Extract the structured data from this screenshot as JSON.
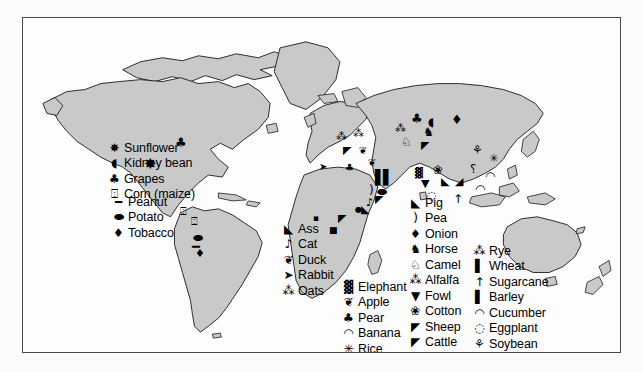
{
  "figure": {
    "kind": "world-map",
    "colors": {
      "land_fill": "#c9c9c9",
      "ocean_fill": "#fdfdfd",
      "outline": "#1a1a1a",
      "frame": "#4a4a4a",
      "page": "#fbfbfb",
      "symbol": "#000000"
    }
  },
  "legends": {
    "north_america": {
      "name": "north-america-legend",
      "items": [
        {
          "label": "Sunflower",
          "icon": "sunflower-icon",
          "glyph": "✸"
        },
        {
          "label": "Kidney bean",
          "icon": "kidney-bean-icon",
          "glyph": "◖"
        },
        {
          "label": "Grapes",
          "icon": "grapes-icon",
          "glyph": "♣"
        },
        {
          "label": "Corn (maize)",
          "icon": "corn-icon",
          "glyph": "⍠"
        }
      ]
    },
    "south_america": {
      "name": "south-america-legend",
      "items": [
        {
          "label": "Peanut",
          "icon": "peanut-icon",
          "glyph": "━"
        },
        {
          "label": "Potato",
          "icon": "potato-icon",
          "glyph": "⬬"
        },
        {
          "label": "Tobacco",
          "icon": "tobacco-icon",
          "glyph": "♦"
        }
      ]
    },
    "africa_left": {
      "name": "africa-left-legend",
      "items": [
        {
          "label": "Ass",
          "icon": "ass-icon",
          "glyph": "◣"
        },
        {
          "label": "Cat",
          "icon": "cat-icon",
          "glyph": "♪"
        },
        {
          "label": "Duck",
          "icon": "duck-icon",
          "glyph": "❦"
        },
        {
          "label": "Rabbit",
          "icon": "rabbit-icon",
          "glyph": "➤"
        },
        {
          "label": "Oats",
          "icon": "oats-icon",
          "glyph": "⁂"
        }
      ]
    },
    "africa_crops": {
      "name": "africa-crops-legend",
      "items": [
        {
          "label": "Elephant",
          "icon": "elephant-icon",
          "glyph": "▓"
        },
        {
          "label": "Apple",
          "icon": "apple-icon",
          "glyph": "❦"
        },
        {
          "label": "Pear",
          "icon": "pear-icon",
          "glyph": "♣"
        },
        {
          "label": "Banana",
          "icon": "banana-icon",
          "glyph": "◠"
        },
        {
          "label": "Rice",
          "icon": "rice-icon",
          "glyph": "✳"
        },
        {
          "label": "Lentil",
          "icon": "lentil-icon",
          "glyph": "⬬"
        }
      ]
    },
    "eurasia_middle": {
      "name": "eurasia-middle-legend",
      "items": [
        {
          "label": "Pig",
          "icon": "pig-icon",
          "glyph": "◣"
        },
        {
          "label": "Pea",
          "icon": "pea-icon",
          "glyph": ")"
        },
        {
          "label": "Onion",
          "icon": "onion-icon",
          "glyph": "♦"
        },
        {
          "label": "Horse",
          "icon": "horse-icon",
          "glyph": "♞"
        },
        {
          "label": "Camel",
          "icon": "camel-icon",
          "glyph": "♘"
        },
        {
          "label": "Alfalfa",
          "icon": "alfalfa-icon",
          "glyph": "⁂"
        },
        {
          "label": "Fowl",
          "icon": "fowl-icon",
          "glyph": "▼"
        },
        {
          "label": "Cotton",
          "icon": "cotton-icon",
          "glyph": "❀"
        },
        {
          "label": "Sheep",
          "icon": "sheep-icon",
          "glyph": "◤"
        },
        {
          "label": "Cattle",
          "icon": "cattle-icon",
          "glyph": "◤"
        },
        {
          "label": "Dog",
          "icon": "dog-icon",
          "glyph": "◢"
        }
      ]
    },
    "asia_right": {
      "name": "asia-right-legend",
      "items": [
        {
          "label": "Rye",
          "icon": "rye-icon",
          "glyph": "⁂"
        },
        {
          "label": "Wheat",
          "icon": "wheat-icon",
          "glyph": "▌"
        },
        {
          "label": "Sugarcane",
          "icon": "sugarcane-icon",
          "glyph": "↑"
        },
        {
          "label": "Barley",
          "icon": "barley-icon",
          "glyph": "▌"
        },
        {
          "label": "Cucumber",
          "icon": "cucumber-icon",
          "glyph": "◠"
        },
        {
          "label": "Eggplant",
          "icon": "eggplant-icon",
          "glyph": "◌"
        },
        {
          "label": "Soybean",
          "icon": "soybean-icon",
          "glyph": "⚘"
        },
        {
          "label": "Millet",
          "icon": "millet-icon",
          "glyph": "⸮"
        }
      ]
    }
  },
  "map_symbols": [
    {
      "name": "symbol-grapes-great-lakes",
      "glyph": "♣",
      "x": 152,
      "y": 118,
      "size": 13
    },
    {
      "name": "symbol-sunflower-plains",
      "glyph": "✸",
      "x": 121,
      "y": 139,
      "size": 15
    },
    {
      "name": "symbol-corn-mexico",
      "glyph": "⍠",
      "x": 157,
      "y": 188,
      "size": 11
    },
    {
      "name": "symbol-corn-andes",
      "glyph": "⍠",
      "x": 168,
      "y": 198,
      "size": 11
    },
    {
      "name": "symbol-potato-andes",
      "glyph": "⬬",
      "x": 170,
      "y": 214,
      "size": 12
    },
    {
      "name": "symbol-peanut-andes",
      "glyph": "━",
      "x": 169,
      "y": 222,
      "size": 13
    },
    {
      "name": "symbol-tobacco-andes",
      "glyph": "♦",
      "x": 172,
      "y": 230,
      "size": 11
    },
    {
      "name": "symbol-oats-europe",
      "glyph": "⁂",
      "x": 313,
      "y": 113,
      "size": 11
    },
    {
      "name": "symbol-rye-europe",
      "glyph": "⁂",
      "x": 330,
      "y": 110,
      "size": 11
    },
    {
      "name": "symbol-cattle-europe",
      "glyph": "◤",
      "x": 320,
      "y": 127,
      "size": 11
    },
    {
      "name": "symbol-duck-europe",
      "glyph": "❦",
      "x": 336,
      "y": 128,
      "size": 10
    },
    {
      "name": "symbol-rabbit-iberia",
      "glyph": "➤",
      "x": 296,
      "y": 144,
      "size": 10
    },
    {
      "name": "symbol-pear-balkans",
      "glyph": "♣",
      "x": 322,
      "y": 145,
      "size": 10
    },
    {
      "name": "symbol-apple-caucasus",
      "glyph": "❦",
      "x": 345,
      "y": 140,
      "size": 10
    },
    {
      "name": "symbol-wheat-fertile-crescent",
      "glyph": "▌",
      "x": 352,
      "y": 152,
      "size": 14
    },
    {
      "name": "symbol-barley-fertile-crescent",
      "glyph": "▌",
      "x": 360,
      "y": 152,
      "size": 14
    },
    {
      "name": "symbol-pea-levant",
      "glyph": ")",
      "x": 346,
      "y": 166,
      "size": 12
    },
    {
      "name": "symbol-lentil-levant",
      "glyph": "⬬",
      "x": 354,
      "y": 168,
      "size": 12
    },
    {
      "name": "symbol-goat-zagros",
      "glyph": "◤",
      "x": 352,
      "y": 176,
      "size": 11
    },
    {
      "name": "symbol-cat-egypt",
      "glyph": "♪",
      "x": 343,
      "y": 179,
      "size": 11
    },
    {
      "name": "symbol-ass-egypt",
      "glyph": "◣",
      "x": 338,
      "y": 186,
      "size": 11
    },
    {
      "name": "symbol-grapes-caspian",
      "glyph": "♣",
      "x": 388,
      "y": 94,
      "size": 13
    },
    {
      "name": "symbol-kidney-central-asia",
      "glyph": "◖",
      "x": 405,
      "y": 98,
      "size": 12
    },
    {
      "name": "symbol-onion-central-asia",
      "glyph": "♦",
      "x": 428,
      "y": 95,
      "size": 13
    },
    {
      "name": "symbol-alfalfa-steppe",
      "glyph": "⁂",
      "x": 372,
      "y": 105,
      "size": 11
    },
    {
      "name": "symbol-horse-steppe",
      "glyph": "♞",
      "x": 400,
      "y": 108,
      "size": 12
    },
    {
      "name": "symbol-camel-bactria",
      "glyph": "♘",
      "x": 378,
      "y": 118,
      "size": 12
    },
    {
      "name": "symbol-sheep-steppe",
      "glyph": "◤",
      "x": 398,
      "y": 122,
      "size": 11
    },
    {
      "name": "symbol-cotton-india",
      "glyph": "❀",
      "x": 410,
      "y": 146,
      "size": 12
    },
    {
      "name": "symbol-fowl-sea",
      "glyph": "▼",
      "x": 398,
      "y": 160,
      "size": 11
    },
    {
      "name": "symbol-pig-china",
      "glyph": "◣",
      "x": 418,
      "y": 158,
      "size": 11
    },
    {
      "name": "symbol-dog-china",
      "glyph": "◢",
      "x": 432,
      "y": 158,
      "size": 11
    },
    {
      "name": "symbol-soybean-china",
      "glyph": "⚘",
      "x": 449,
      "y": 126,
      "size": 12
    },
    {
      "name": "symbol-millet-china",
      "glyph": "⸮",
      "x": 447,
      "y": 145,
      "size": 12
    },
    {
      "name": "symbol-cucumber-india",
      "glyph": "◠",
      "x": 462,
      "y": 152,
      "size": 12
    },
    {
      "name": "symbol-rice-se-asia",
      "glyph": "✳",
      "x": 466,
      "y": 135,
      "size": 11
    },
    {
      "name": "symbol-sugarcane-ng",
      "glyph": "↑",
      "x": 430,
      "y": 175,
      "size": 12
    },
    {
      "name": "symbol-banana-ng",
      "glyph": "◠",
      "x": 452,
      "y": 165,
      "size": 12
    },
    {
      "name": "symbol-eggplant-india",
      "glyph": "◌",
      "x": 404,
      "y": 172,
      "size": 11
    },
    {
      "name": "symbol-elephant-india",
      "glyph": "▓",
      "x": 392,
      "y": 150,
      "size": 10
    },
    {
      "name": "symbol-sorghum-sahel",
      "glyph": "▪",
      "x": 290,
      "y": 196,
      "size": 9
    },
    {
      "name": "symbol-coffee-ethiopia",
      "glyph": "●",
      "x": 332,
      "y": 188,
      "size": 8
    },
    {
      "name": "symbol-yam-wafrica",
      "glyph": "■",
      "x": 306,
      "y": 208,
      "size": 9
    },
    {
      "name": "symbol-cattle-eafrica",
      "glyph": "◤",
      "x": 315,
      "y": 195,
      "size": 11
    }
  ]
}
